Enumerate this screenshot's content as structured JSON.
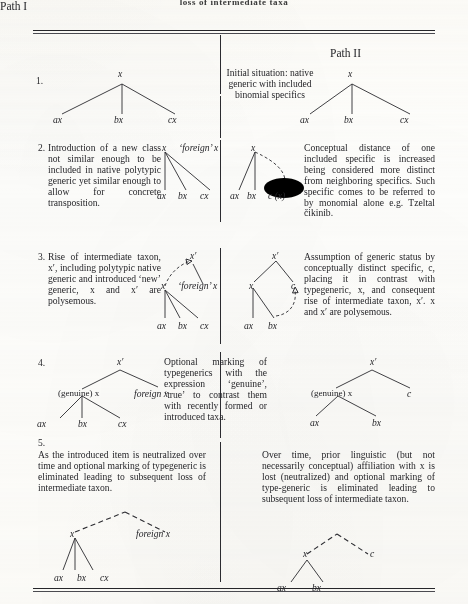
{
  "running_head": "loss of intermediate taxa",
  "columns": {
    "path_one": "Path I",
    "path_two": "Path II"
  },
  "node_labels": {
    "x": "x",
    "x_prime": "x′",
    "ax": "ax",
    "bx": "bx",
    "cx": "cx",
    "c": "c",
    "c_paren_x": "c (x)",
    "foreign_x_quoted": "‘foreign’ x",
    "foreign_x": "foreign x",
    "genuine_x": "(genuine) x"
  },
  "stages": [
    {
      "number": "1.",
      "center_text": "Initial situation: native generic with included binomial specifics",
      "left_text": "",
      "right_text": ""
    },
    {
      "number": "2.",
      "left_text": "Introduction of a new class not similar enough to be included in native polytypic generic yet similar enough to allow for concrete transposition.",
      "right_text": "Conceptual distance of one included specific is increased being considered more distinct from neighboring specifics. Such specific comes to be referred to by monomial alone e.g. Tzeltal čikinib."
    },
    {
      "number": "3.",
      "left_text": "Rise of intermediate taxon, x′, including polytypic native generic and introduced ‘new’ generic, x and x′ are polysemous.",
      "right_text": "Assumption of generic status by conceptually distinct specific, c, placing it in contrast with typegeneric, x, and consequent rise of intermediate taxon, x′. x and x′ are polysemous."
    },
    {
      "number": "4.",
      "center_text": "Optional marking of typegenerics with the expression ‘genuine’, ‘true’ to contrast them with recently formed or introduced taxa.",
      "left_text": "",
      "right_text": ""
    },
    {
      "number": "5.",
      "left_text": "As the introduced item is neutralized over time and optional marking of typegeneric is eliminated leading to subsequent loss of intermediate taxon.",
      "right_text": "Over time, prior linguistic (but not necessarily conceptual) affiliation with x is lost (neutralized) and optional marking of type-generic is eliminated leading to subsequent loss of intermediate taxon."
    }
  ],
  "colors": {
    "ink": "#26262a",
    "paper": "#fdfdfb"
  }
}
